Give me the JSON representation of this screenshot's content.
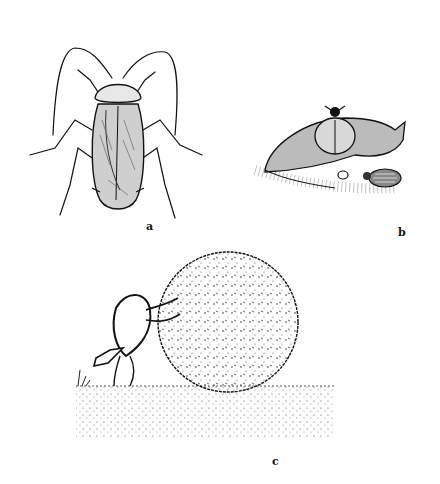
{
  "figure": {
    "panels": [
      {
        "id": "a",
        "label": "a",
        "subject": "cockroach",
        "view": "dorsal"
      },
      {
        "id": "b",
        "label": "b",
        "subject": "carrion beetles on dead mouse"
      },
      {
        "id": "c",
        "label": "c",
        "subject": "dung beetle rolling dung ball"
      }
    ],
    "colors": {
      "ink": "#111111",
      "background": "#ffffff",
      "ground": "#555555"
    }
  }
}
